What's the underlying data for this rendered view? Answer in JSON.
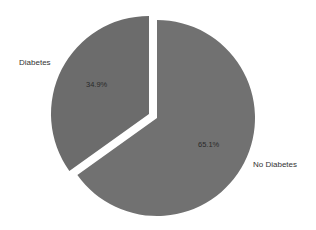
{
  "chart_data": {
    "type": "pie",
    "title": "",
    "slices": [
      {
        "label": "No Diabetes",
        "value": 65.1,
        "display": "65.1%",
        "color": "#717171",
        "exploded": false
      },
      {
        "label": "Diabetes",
        "value": 34.9,
        "display": "34.9%",
        "color": "#6c6c6c",
        "exploded": true
      }
    ],
    "start_angle_deg": 0,
    "direction": "clockwise",
    "legend": "none (outside slice labels)"
  },
  "labels": {
    "diabetes": "Diabetes",
    "no_diabetes": "No Diabetes",
    "diabetes_pct": "34.9%",
    "no_diabetes_pct": "65.1%"
  }
}
